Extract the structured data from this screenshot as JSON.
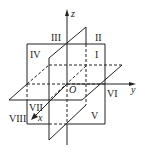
{
  "diagram": {
    "axes": {
      "x": "x",
      "y": "y",
      "z": "z",
      "origin": "O"
    },
    "octants": [
      "I",
      "II",
      "III",
      "IV",
      "V",
      "VI",
      "VII",
      "VIII"
    ],
    "colors": {
      "line": "#222222",
      "background": "#ffffff"
    }
  }
}
